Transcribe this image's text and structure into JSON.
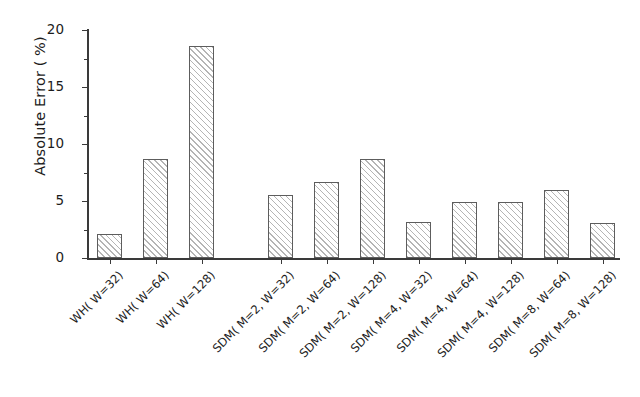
{
  "chart_data": {
    "type": "bar",
    "title": "",
    "xlabel": "",
    "ylabel": "Absolute Error ( %)",
    "ylim": [
      0,
      20
    ],
    "yticks": [
      0,
      5,
      10,
      15,
      20
    ],
    "ytick_labels": [
      "0",
      "5",
      "10",
      "15",
      "20"
    ],
    "yminor_ticks": [
      2.5,
      7.5,
      12.5,
      17.5
    ],
    "grid": false,
    "legend": "none",
    "bar_style": "hatched-diagonal-45",
    "categories": [
      "WH( W=32)",
      "WH( W=64)",
      "WH( W=128)",
      "SDM( M=2, W=32)",
      "SDM( M=2, W=64)",
      "SDM( M=2, W=128)",
      "SDM( M=4, W=32)",
      "SDM( M=4, W=64)",
      "SDM( M=4, W=128)",
      "SDM( M=8, W=64)",
      "SDM( M=8, W=128)"
    ],
    "values": [
      2.1,
      8.7,
      18.6,
      5.5,
      6.7,
      8.7,
      3.2,
      4.9,
      4.9,
      6.0,
      3.1
    ],
    "bar_left_px": [
      97,
      143,
      189,
      268,
      314,
      360,
      406,
      452,
      498,
      544,
      590
    ],
    "bar_width_px": 25,
    "colors": {
      "bar_edge": "#5d5d5d",
      "bar_hatch": "#787878",
      "axis": "#3a3a3a",
      "text": "#1c1c1c",
      "background": "#ffffff"
    }
  }
}
